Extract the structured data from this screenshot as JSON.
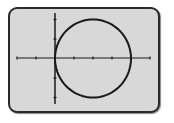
{
  "screen": {
    "background": "#d8d8d8",
    "border_color": "#2a2a2a"
  },
  "chart_data": {
    "type": "line",
    "title": "",
    "xlabel": "",
    "ylabel": "",
    "equation": "(x-2)^2 + y^2 = 4",
    "center": [
      2,
      0
    ],
    "radius": 2,
    "xlim": [
      -2,
      5
    ],
    "ylim": [
      -2.4,
      2.4
    ],
    "x_ticks": [
      -2,
      -1,
      1,
      2,
      3,
      4,
      5
    ],
    "y_ticks": [
      -2,
      -1,
      1,
      2
    ],
    "grid": false,
    "legend": null,
    "series": [
      {
        "name": "circle",
        "color": "#1a1a1a"
      }
    ]
  }
}
